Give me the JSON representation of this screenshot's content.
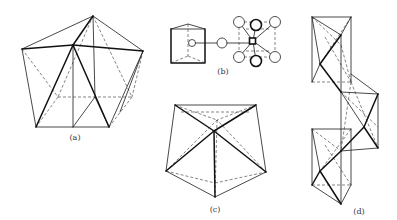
{
  "figure": {
    "panels": [
      {
        "id": "a",
        "label": "(a)",
        "description": "Pentagonal prism-like polyhedron with apex"
      },
      {
        "id": "b",
        "label": "(b)",
        "description": "Trigonal prism linked to cubic arrangement of atoms"
      },
      {
        "id": "c",
        "label": "(c)",
        "description": "Pentagonal bipyramid view"
      },
      {
        "id": "d",
        "label": "(d)",
        "description": "Chain of three edge/corner-sharing octahedra"
      }
    ]
  },
  "colors": {
    "background": "#ffffff",
    "line": "#1a1a1a"
  }
}
